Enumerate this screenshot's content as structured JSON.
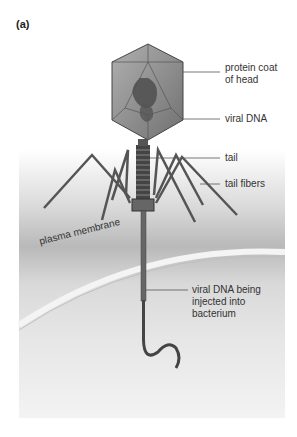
{
  "panel_label": "(a)",
  "labels": {
    "protein_coat": [
      "protein coat",
      "of head"
    ],
    "viral_dna": "viral DNA",
    "tail": "tail",
    "tail_fibers": "tail fibers",
    "plasma_membrane": "plasma membrane",
    "injected": [
      "viral DNA being",
      "injected into",
      "bacterium"
    ]
  }
}
